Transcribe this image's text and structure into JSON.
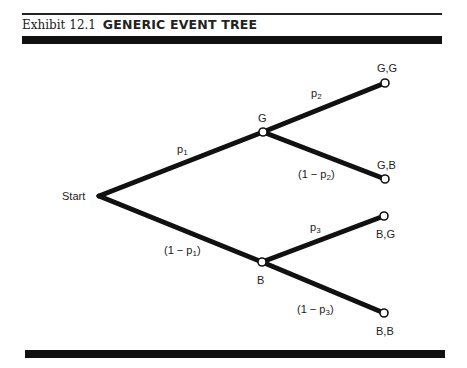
{
  "exhibit": {
    "number_label": "Exhibit 12.1",
    "title": "GENERIC EVENT TREE"
  },
  "tree": {
    "start_label": "Start",
    "nodes": {
      "G": "G",
      "B": "B",
      "GG": "G,G",
      "GB": "G,B",
      "BG": "B,G",
      "BB": "B,B"
    },
    "branches": {
      "start_G": {
        "base": "p",
        "sub": "1",
        "prefix": "",
        "suffix": ""
      },
      "start_B": {
        "base": "p",
        "sub": "1",
        "prefix": "(1 − ",
        "suffix": ")"
      },
      "G_GG": {
        "base": "p",
        "sub": "2",
        "prefix": "",
        "suffix": ""
      },
      "G_GB": {
        "base": "p",
        "sub": "2",
        "prefix": "(1 − ",
        "suffix": ")"
      },
      "B_BG": {
        "base": "p",
        "sub": "3",
        "prefix": "",
        "suffix": ""
      },
      "B_BB": {
        "base": "p",
        "sub": "3",
        "prefix": "(1 − ",
        "suffix": ")"
      }
    }
  },
  "colors": {
    "ink": "#111111",
    "background": "#ffffff"
  }
}
